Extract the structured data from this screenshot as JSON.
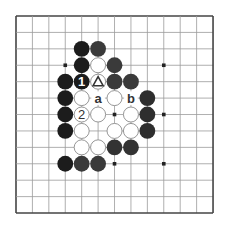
{
  "diagram": {
    "type": "go-board-problem",
    "board": {
      "lines": 13,
      "origin": [
        16,
        16
      ],
      "spacing": 16.42,
      "line_color": "#9a9a9a",
      "border_color": "#444444",
      "background": "#ffffff"
    },
    "star_points": [
      [
        3,
        3
      ],
      [
        9,
        3
      ],
      [
        6,
        6
      ],
      [
        9,
        6
      ],
      [
        6,
        9
      ],
      [
        9,
        9
      ]
    ],
    "stones": {
      "black": [
        {
          "c": 4,
          "r": 2,
          "tone": "#1c1c1c"
        },
        {
          "c": 5,
          "r": 2,
          "tone": "#3a3a3a"
        },
        {
          "c": 4,
          "r": 3,
          "tone": "#1c1c1c"
        },
        {
          "c": 6,
          "r": 3,
          "tone": "#3a3a3a"
        },
        {
          "c": 3,
          "r": 4,
          "tone": "#1c1c1c"
        },
        {
          "c": 4,
          "r": 4,
          "tone": "#1c1c1c",
          "label": "1"
        },
        {
          "c": 6,
          "r": 4,
          "tone": "#3a3a3a"
        },
        {
          "c": 7,
          "r": 4,
          "tone": "#3a3a3a"
        },
        {
          "c": 3,
          "r": 5,
          "tone": "#1c1c1c"
        },
        {
          "c": 8,
          "r": 5,
          "tone": "#2e2e2e"
        },
        {
          "c": 3,
          "r": 6,
          "tone": "#1c1c1c"
        },
        {
          "c": 8,
          "r": 6,
          "tone": "#2e2e2e"
        },
        {
          "c": 3,
          "r": 7,
          "tone": "#1c1c1c"
        },
        {
          "c": 8,
          "r": 7,
          "tone": "#2e2e2e"
        },
        {
          "c": 6,
          "r": 8,
          "tone": "#333333"
        },
        {
          "c": 7,
          "r": 8,
          "tone": "#333333"
        },
        {
          "c": 3,
          "r": 9,
          "tone": "#1c1c1c"
        },
        {
          "c": 4,
          "r": 9,
          "tone": "#3a3a3a"
        },
        {
          "c": 5,
          "r": 9,
          "tone": "#3a3a3a"
        }
      ],
      "white": [
        {
          "c": 5,
          "r": 3
        },
        {
          "c": 5,
          "r": 4,
          "marker": "triangle"
        },
        {
          "c": 4,
          "r": 5
        },
        {
          "c": 6,
          "r": 5
        },
        {
          "c": 4,
          "r": 6,
          "label": "2"
        },
        {
          "c": 5,
          "r": 6
        },
        {
          "c": 7,
          "r": 6
        },
        {
          "c": 4,
          "r": 7
        },
        {
          "c": 6,
          "r": 7
        },
        {
          "c": 7,
          "r": 7
        },
        {
          "c": 4,
          "r": 8
        },
        {
          "c": 5,
          "r": 8
        }
      ]
    },
    "point_labels": [
      {
        "c": 5,
        "r": 5,
        "text": "a"
      },
      {
        "c": 7,
        "r": 5,
        "text": "b"
      }
    ],
    "colors": {
      "white_stone_fill": "#ffffff",
      "white_stone_stroke": "#8a8a8a",
      "label_on_black": "#ffffff",
      "label_on_white": "#333333",
      "point_label": "#333333",
      "star": "#222222"
    }
  }
}
